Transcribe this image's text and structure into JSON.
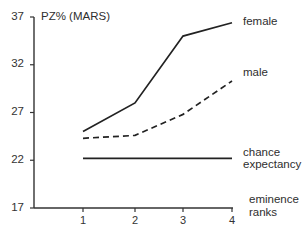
{
  "chart_data": {
    "type": "line",
    "title": "",
    "ylabel": "PZ% (MARS)",
    "xlabel": "eminence ranks",
    "xlabel_lines": [
      "eminence",
      "ranks"
    ],
    "x": [
      1,
      2,
      3,
      4
    ],
    "x_tick_labels": [
      "1",
      "2",
      "3",
      "4"
    ],
    "y_ticks": [
      17,
      22,
      27,
      32,
      37
    ],
    "y_tick_labels": [
      "17",
      "22",
      "27",
      "32",
      "37"
    ],
    "ylim": [
      17,
      37
    ],
    "grid": false,
    "legend_position": "inline-right",
    "series": [
      {
        "name": "female",
        "label_lines": [
          "female"
        ],
        "values": [
          25.0,
          28.0,
          35.0,
          36.4
        ],
        "style": "solid",
        "color": "#222222"
      },
      {
        "name": "male",
        "label_lines": [
          "male"
        ],
        "values": [
          24.3,
          24.6,
          26.8,
          30.3
        ],
        "style": "dashed",
        "color": "#222222"
      },
      {
        "name": "chance expectancy",
        "label_lines": [
          "chance",
          "expectancy"
        ],
        "values": [
          22.2,
          22.2,
          22.2,
          22.2
        ],
        "style": "solid",
        "color": "#222222"
      }
    ]
  }
}
